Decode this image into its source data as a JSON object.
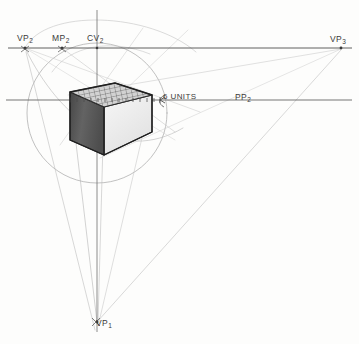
{
  "drawing": {
    "title": "Two-point perspective cube construction",
    "canvas": {
      "width": 359,
      "height": 344,
      "background": "#fdfdfc"
    },
    "labels": {
      "vp2": {
        "text": "VP",
        "sub": "2",
        "name": "vanishing-point-2-label",
        "x": 25,
        "y": 48
      },
      "mp2": {
        "text": "MP",
        "sub": "2",
        "name": "measuring-point-2-label",
        "x": 62,
        "y": 48
      },
      "cv2": {
        "text": "CV",
        "sub": "2",
        "name": "center-of-vision-label",
        "x": 97,
        "y": 48
      },
      "vp3": {
        "text": "VP",
        "sub": "3",
        "name": "vanishing-point-3-label",
        "x": 341,
        "y": 48
      },
      "vp1": {
        "text": "VP",
        "sub": "1",
        "name": "vanishing-point-1-label",
        "x": 97,
        "y": 322
      },
      "units": {
        "text": "6 UNITS",
        "name": "six-units-annotation",
        "x": 163,
        "y": 100
      },
      "pp2": {
        "text": "PP",
        "sub": "2",
        "name": "picture-plane-2-label",
        "x": 240,
        "y": 100
      }
    },
    "key_points": {
      "vanishing_point_2": [
        25,
        48
      ],
      "measuring_point_2": [
        62,
        48
      ],
      "center_of_vision": [
        97,
        48
      ],
      "vanishing_point_3": [
        341,
        48
      ],
      "vanishing_point_1": [
        97,
        322
      ],
      "station_point": [
        97,
        100
      ],
      "measure_point_6_units": [
        160,
        100
      ]
    },
    "lines": {
      "horizon_line": {
        "name": "horizon-line",
        "x1": 8,
        "y1": 48,
        "x2": 352,
        "y2": 48,
        "color": "#4a4a4a"
      },
      "ground_measuring_line": {
        "name": "ground-measuring-line",
        "x1": 6,
        "y1": 100,
        "x2": 352,
        "y2": 100,
        "color": "#5a5a5a"
      },
      "vertical_axis": {
        "name": "vertical-central-axis",
        "x1": 97,
        "y1": 10,
        "x2": 97,
        "y2": 330,
        "color": "#6a6a6a"
      }
    },
    "circles": {
      "cone_of_vision": {
        "name": "cone-of-vision-circle",
        "cx": 97,
        "cy": 113,
        "r": 70,
        "color": "#9a9a9a"
      },
      "construction_arc": {
        "name": "construction-arc",
        "cx": 25,
        "cy": 48,
        "r": 155,
        "color": "#b0b0b0"
      }
    },
    "cube": {
      "name": "perspective-cube",
      "top_face_fill": "#cfcfcf",
      "left_face_fill": "#5e5e5e",
      "right_face_fill": "#efefef",
      "outline": "#2b2b2b",
      "grid_divisions": 10,
      "vertices": {
        "top_back": [
          115,
          83
        ],
        "top_left": [
          70,
          92
        ],
        "top_front": [
          104,
          107
        ],
        "top_right": [
          152,
          95
        ],
        "bot_left": [
          70,
          140
        ],
        "bot_front": [
          104,
          155
        ],
        "bot_right": [
          152,
          132
        ]
      }
    },
    "tick_marks": {
      "name": "measuring-tick-marks",
      "count": 14,
      "start_x": 70,
      "end_x": 160,
      "y": 100
    }
  }
}
